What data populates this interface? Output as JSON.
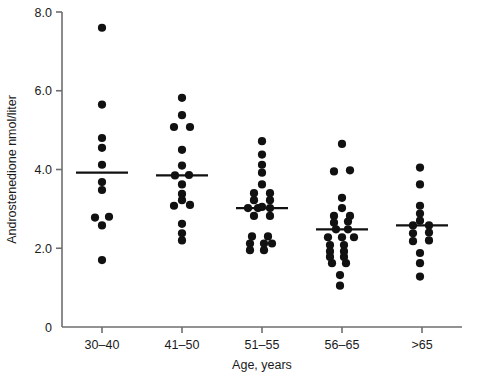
{
  "chart_data": {
    "type": "scatter",
    "title": "",
    "xlabel": "Age, years",
    "ylabel": "Androstenedione nmol/liter",
    "categories": [
      "30–40",
      "41–50",
      "51–55",
      "56–65",
      ">65"
    ],
    "ylim": [
      0,
      8.0
    ],
    "ytick_labels": [
      "0",
      "2.0",
      "4.0",
      "6.0",
      "8.0"
    ],
    "ytick_values": [
      0,
      2.0,
      4.0,
      6.0,
      8.0
    ],
    "grid": false,
    "legend": "none",
    "marker_color": "#111111",
    "axis_color": "#6e6e6e",
    "background_color": "#ffffff",
    "series": [
      {
        "name": "30–40",
        "median": 3.92,
        "n": 11,
        "points": [
          {
            "value": 7.6,
            "offset": 0
          },
          {
            "value": 5.65,
            "offset": 0
          },
          {
            "value": 4.8,
            "offset": 0
          },
          {
            "value": 4.55,
            "offset": 0
          },
          {
            "value": 4.12,
            "offset": 0
          },
          {
            "value": 3.68,
            "offset": 0
          },
          {
            "value": 3.48,
            "offset": 0
          },
          {
            "value": 2.78,
            "offset": -7
          },
          {
            "value": 2.8,
            "offset": 7
          },
          {
            "value": 2.58,
            "offset": 0
          },
          {
            "value": 1.7,
            "offset": 0
          }
        ]
      },
      {
        "name": "41–50",
        "median": 3.85,
        "n": 16,
        "points": [
          {
            "value": 5.82,
            "offset": 0
          },
          {
            "value": 5.38,
            "offset": 0
          },
          {
            "value": 5.08,
            "offset": -8
          },
          {
            "value": 5.08,
            "offset": 8
          },
          {
            "value": 4.5,
            "offset": 0
          },
          {
            "value": 4.1,
            "offset": 0
          },
          {
            "value": 3.85,
            "offset": -7
          },
          {
            "value": 3.86,
            "offset": 7
          },
          {
            "value": 3.62,
            "offset": 0
          },
          {
            "value": 3.38,
            "offset": 0
          },
          {
            "value": 3.22,
            "offset": 0
          },
          {
            "value": 3.08,
            "offset": -8
          },
          {
            "value": 3.1,
            "offset": 8
          },
          {
            "value": 2.62,
            "offset": 0
          },
          {
            "value": 2.38,
            "offset": 0
          },
          {
            "value": 2.2,
            "offset": 0
          }
        ]
      },
      {
        "name": "51–55",
        "median": 3.02,
        "n": 22,
        "points": [
          {
            "value": 4.72,
            "offset": 0
          },
          {
            "value": 4.38,
            "offset": 0
          },
          {
            "value": 4.12,
            "offset": 0
          },
          {
            "value": 3.92,
            "offset": 0
          },
          {
            "value": 3.62,
            "offset": 0
          },
          {
            "value": 3.4,
            "offset": -8
          },
          {
            "value": 3.4,
            "offset": 8
          },
          {
            "value": 3.22,
            "offset": -8
          },
          {
            "value": 3.22,
            "offset": 8
          },
          {
            "value": 3.05,
            "offset": 0
          },
          {
            "value": 3.02,
            "offset": -14
          },
          {
            "value": 3.02,
            "offset": -4
          },
          {
            "value": 3.02,
            "offset": 8
          },
          {
            "value": 2.82,
            "offset": -8
          },
          {
            "value": 2.82,
            "offset": 8
          },
          {
            "value": 2.3,
            "offset": -10
          },
          {
            "value": 2.3,
            "offset": 6
          },
          {
            "value": 2.12,
            "offset": -12
          },
          {
            "value": 2.12,
            "offset": 2
          },
          {
            "value": 2.12,
            "offset": 10
          },
          {
            "value": 1.95,
            "offset": -12
          },
          {
            "value": 1.95,
            "offset": 2
          }
        ]
      },
      {
        "name": "56–65",
        "median": 2.48,
        "n": 24,
        "points": [
          {
            "value": 4.65,
            "offset": 0
          },
          {
            "value": 3.95,
            "offset": -8
          },
          {
            "value": 3.98,
            "offset": 8
          },
          {
            "value": 3.28,
            "offset": 0
          },
          {
            "value": 3.02,
            "offset": 0
          },
          {
            "value": 2.82,
            "offset": -8
          },
          {
            "value": 2.82,
            "offset": 8
          },
          {
            "value": 2.65,
            "offset": -8
          },
          {
            "value": 2.68,
            "offset": 6
          },
          {
            "value": 2.48,
            "offset": -6
          },
          {
            "value": 2.48,
            "offset": 6
          },
          {
            "value": 2.28,
            "offset": -14
          },
          {
            "value": 2.28,
            "offset": 0
          },
          {
            "value": 2.28,
            "offset": 12
          },
          {
            "value": 2.08,
            "offset": -12
          },
          {
            "value": 2.08,
            "offset": 2
          },
          {
            "value": 1.92,
            "offset": -12
          },
          {
            "value": 1.92,
            "offset": 2
          },
          {
            "value": 1.78,
            "offset": -12
          },
          {
            "value": 1.78,
            "offset": 2
          },
          {
            "value": 1.62,
            "offset": -10
          },
          {
            "value": 1.62,
            "offset": 4
          },
          {
            "value": 1.32,
            "offset": -2
          },
          {
            "value": 1.05,
            "offset": -2
          }
        ]
      },
      {
        "name": ">65",
        "median": 2.58,
        "n": 13,
        "points": [
          {
            "value": 4.05,
            "offset": -2
          },
          {
            "value": 3.62,
            "offset": -2
          },
          {
            "value": 3.08,
            "offset": -2
          },
          {
            "value": 2.88,
            "offset": -2
          },
          {
            "value": 2.7,
            "offset": -2
          },
          {
            "value": 2.58,
            "offset": -9
          },
          {
            "value": 2.58,
            "offset": 7
          },
          {
            "value": 2.38,
            "offset": -9
          },
          {
            "value": 2.4,
            "offset": 7
          },
          {
            "value": 2.18,
            "offset": -9
          },
          {
            "value": 2.2,
            "offset": 7
          },
          {
            "value": 1.88,
            "offset": -2
          },
          {
            "value": 1.62,
            "offset": -2
          },
          {
            "value": 1.28,
            "offset": -2
          }
        ]
      }
    ]
  }
}
